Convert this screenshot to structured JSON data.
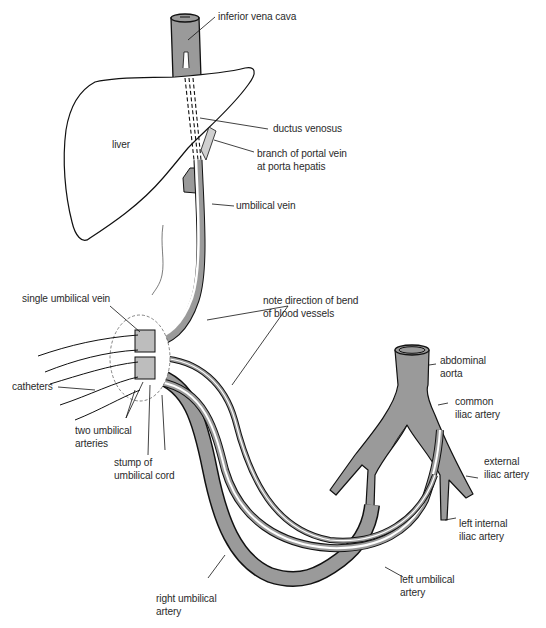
{
  "diagram": {
    "type": "anatomical illustration",
    "colors": {
      "vessel_fill": "#9a9a9a",
      "vessel_light": "#bdbdbd",
      "outline": "#111111",
      "background": "#ffffff"
    },
    "labels": {
      "inferior_vena_cava": "inferior vena cava",
      "liver": "liver",
      "ductus_venosus": "ductus venosus",
      "branch_portal_vein": "branch of portal vein\nat porta hepatis",
      "umbilical_vein": "umbilical vein",
      "single_umbilical_vein": "single umbilical vein",
      "note_direction": "note direction of bend\nof blood vessels",
      "catheters": "catheters",
      "two_umbilical_arteries": "two umbilical\narteries",
      "stump_umbilical_cord": "stump of\numbilical cord",
      "abdominal_aorta": "abdominal\naorta",
      "common_iliac_artery": "common\niliac artery",
      "external_iliac_artery": "external\niliac artery",
      "left_internal_iliac_artery": "left internal\niliac artery",
      "left_umbilical_artery": "left umbilical\nartery",
      "right_umbilical_artery": "right umbilical\nartery"
    }
  }
}
